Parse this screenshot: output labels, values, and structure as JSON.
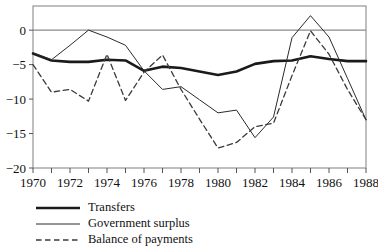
{
  "chart_data": {
    "type": "line",
    "title": "",
    "subtitle": "",
    "xlabel": "",
    "ylabel": "",
    "xlim": [
      1970,
      1988
    ],
    "ylim": [
      -20,
      3.5
    ],
    "grid": false,
    "zero_line": true,
    "axis_frame": "box",
    "legend_position": "below-left",
    "x": [
      1970,
      1971,
      1972,
      1973,
      1974,
      1975,
      1976,
      1977,
      1978,
      1979,
      1980,
      1981,
      1982,
      1983,
      1984,
      1985,
      1986,
      1987,
      1988
    ],
    "xticks": [
      1970,
      1971,
      1972,
      1973,
      1974,
      1975,
      1976,
      1977,
      1978,
      1979,
      1980,
      1981,
      1982,
      1983,
      1984,
      1985,
      1986,
      1987,
      1988
    ],
    "xtick_labels": [
      "1970",
      "",
      "1972",
      "",
      "1974",
      "",
      "1976",
      "",
      "1978",
      "",
      "1980",
      "",
      "1982",
      "",
      "1984",
      "",
      "1986",
      "",
      "1988"
    ],
    "yticks": [
      0,
      -5,
      -10,
      -15,
      -20
    ],
    "ytick_labels": [
      "0",
      "−5",
      "−10",
      "−15",
      "−20"
    ],
    "series": [
      {
        "name": "Transfers",
        "style": "solid",
        "width": 2.6,
        "color": "#1a1a1a",
        "values": [
          -3.4,
          -4.4,
          -4.6,
          -4.6,
          -4.3,
          -4.4,
          -5.9,
          -5.3,
          -5.5,
          -6.0,
          -6.5,
          -6.0,
          -4.9,
          -4.5,
          -4.4,
          -3.8,
          -4.2,
          -4.5,
          -4.5
        ]
      },
      {
        "name": "Government surplus",
        "style": "solid",
        "width": 1.0,
        "color": "#2b2b2b",
        "values": [
          -3.3,
          -4.3,
          -2.2,
          0.0,
          -1.0,
          -2.2,
          -5.9,
          -8.6,
          -8.2,
          -10.1,
          -12.0,
          -11.6,
          -15.6,
          -12.6,
          -1.1,
          2.1,
          -1.0,
          -7.0,
          -13.0
        ]
      },
      {
        "name": "Balance of payments",
        "style": "dashed",
        "width": 1.3,
        "color": "#3a3a3a",
        "values": [
          -5.0,
          -9.0,
          -8.6,
          -10.3,
          -3.5,
          -10.2,
          -6.1,
          -3.6,
          -8.6,
          -12.9,
          -17.1,
          -16.3,
          -14.0,
          -13.5,
          -6.6,
          -0.1,
          -3.5,
          -8.6,
          -13.0
        ]
      }
    ]
  },
  "legend": {
    "entries": [
      {
        "label": "Transfers",
        "swatch": "thick-solid-line"
      },
      {
        "label": "Government surplus",
        "swatch": "thin-solid-line"
      },
      {
        "label": "Balance of payments",
        "swatch": "dashed-line"
      }
    ]
  }
}
